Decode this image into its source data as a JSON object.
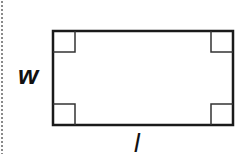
{
  "diagram": {
    "type": "rectangle-with-right-angles",
    "labels": {
      "width": "w",
      "length": "l"
    },
    "stroke_color": "#1a1a1a",
    "border_style": "dotted-left-edge"
  }
}
